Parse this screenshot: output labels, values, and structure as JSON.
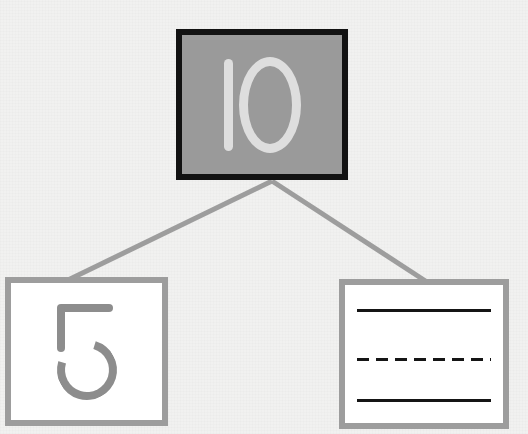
{
  "worksheet": {
    "type": "number-bond",
    "background_color": "#f1f1f0",
    "whole": {
      "value": "10",
      "digits": [
        "1",
        "0"
      ],
      "fill_color": "#9a9a9a",
      "border_color": "#121212",
      "text_color": "#dedede"
    },
    "parts": [
      {
        "id": "part-left",
        "value": "5",
        "kind": "number",
        "fill_color": "#ffffff",
        "border_color": "#9d9d9d",
        "text_color": "#8d8d8d"
      },
      {
        "id": "part-right",
        "value": "",
        "kind": "blank-writing-lines",
        "fill_color": "#ffffff",
        "border_color": "#9d9d9d",
        "lines": [
          {
            "id": "rule-top",
            "style": "solid",
            "color": "#151515"
          },
          {
            "id": "rule-mid",
            "style": "dashed",
            "color": "#151515"
          },
          {
            "id": "rule-bottom",
            "style": "solid",
            "color": "#151515"
          }
        ]
      }
    ],
    "connectors": {
      "color": "#9d9d9d",
      "width": 5,
      "origin": {
        "x": 272,
        "y": 181
      },
      "left_end": {
        "x": 66,
        "y": 281
      },
      "right_end": {
        "x": 427,
        "y": 282
      }
    }
  }
}
